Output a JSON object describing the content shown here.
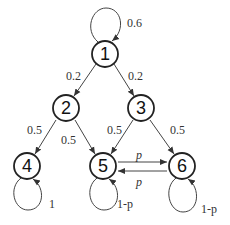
{
  "diagram": {
    "type": "markov-chain",
    "nodes": [
      {
        "id": "1",
        "label": "1",
        "x": 105,
        "y": 54
      },
      {
        "id": "2",
        "label": "2",
        "x": 66,
        "y": 108
      },
      {
        "id": "3",
        "label": "3",
        "x": 141,
        "y": 108
      },
      {
        "id": "4",
        "label": "4",
        "x": 27,
        "y": 166
      },
      {
        "id": "5",
        "label": "5",
        "x": 103,
        "y": 166
      },
      {
        "id": "6",
        "label": "6",
        "x": 182,
        "y": 166
      }
    ],
    "edges": [
      {
        "from": "1",
        "to": "1",
        "label": "0.6"
      },
      {
        "from": "1",
        "to": "2",
        "label": "0.2"
      },
      {
        "from": "1",
        "to": "3",
        "label": "0.2"
      },
      {
        "from": "2",
        "to": "4",
        "label": "0.5"
      },
      {
        "from": "2",
        "to": "5",
        "label": "0.5"
      },
      {
        "from": "3",
        "to": "5",
        "label": "0.5"
      },
      {
        "from": "3",
        "to": "6",
        "label": "0.5"
      },
      {
        "from": "5",
        "to": "6",
        "label": "p"
      },
      {
        "from": "6",
        "to": "5",
        "label": "p"
      },
      {
        "from": "4",
        "to": "4",
        "label": "1"
      },
      {
        "from": "5",
        "to": "5",
        "label": "1-p"
      },
      {
        "from": "6",
        "to": "6",
        "label": "1-p"
      }
    ]
  }
}
